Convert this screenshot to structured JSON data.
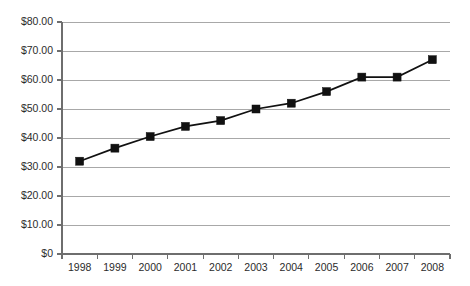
{
  "chart_data": {
    "type": "line",
    "title": "",
    "subtitle": "",
    "xlabel": "",
    "ylabel": "",
    "categories": [
      "1998",
      "1999",
      "2000",
      "2001",
      "2002",
      "2003",
      "2004",
      "2005",
      "2006",
      "2007",
      "2008"
    ],
    "values": [
      32.0,
      36.5,
      40.5,
      44.0,
      46.0,
      50.0,
      52.0,
      56.0,
      61.0,
      61.0,
      67.0
    ],
    "series": [
      {
        "name": "",
        "values": [
          32.0,
          36.5,
          40.5,
          44.0,
          46.0,
          50.0,
          52.0,
          56.0,
          61.0,
          61.0,
          67.0
        ]
      }
    ],
    "ylim": [
      0,
      80
    ],
    "ytick_values": [
      0,
      10,
      20,
      30,
      40,
      50,
      60,
      70,
      80
    ],
    "ytick_labels": [
      "$0",
      "$10.00",
      "$20.00",
      "$30.00",
      "$40.00",
      "$50.00",
      "$60.00",
      "$70.00",
      "$80.00"
    ],
    "xtick_labels": [
      "1998",
      "1999",
      "2000",
      "2001",
      "2002",
      "2003",
      "2004",
      "2005",
      "2006",
      "2007",
      "2008"
    ],
    "grid": true,
    "grid_axis": "y",
    "legend": false,
    "legend_position": "none",
    "marker": "square",
    "marker_color": "#111111",
    "line_color": "#111111",
    "gridline_color": "#a8a8a8",
    "axis_color": "#6e6e6e",
    "background_color": "#ffffff",
    "annotations": []
  },
  "geometry": {
    "plot_left": 62,
    "plot_right": 450,
    "plot_top": 22,
    "plot_bottom": 254,
    "marker_size": 8
  }
}
